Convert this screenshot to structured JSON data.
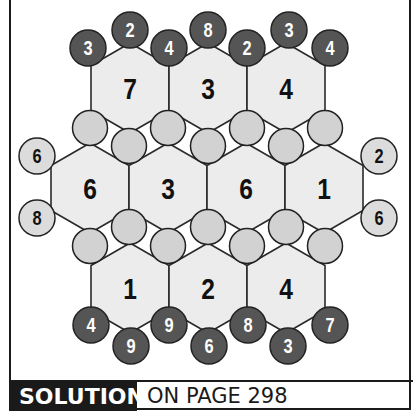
{
  "puzzle": {
    "colors": {
      "hex_fill": "#ececec",
      "hex_stroke": "#2a2a2a",
      "gap_circle_fill": "#d2d2d2",
      "dark_clue_fill": "#555555",
      "light_clue_fill": "#dcdcdc",
      "stroke": "#222222",
      "dark_text": "#ffffff",
      "light_text": "#111111",
      "hex_text": "#111111"
    },
    "hex_radius": 45,
    "hexes": [
      {
        "cx": 130,
        "cy": 88,
        "value": "7"
      },
      {
        "cx": 208,
        "cy": 88,
        "value": "3"
      },
      {
        "cx": 286,
        "cy": 88,
        "value": "4"
      },
      {
        "cx": 90,
        "cy": 188,
        "value": "6"
      },
      {
        "cx": 168,
        "cy": 188,
        "value": "3"
      },
      {
        "cx": 246,
        "cy": 188,
        "value": "6"
      },
      {
        "cx": 324,
        "cy": 188,
        "value": "1"
      },
      {
        "cx": 130,
        "cy": 288,
        "value": "1"
      },
      {
        "cx": 208,
        "cy": 288,
        "value": "2"
      },
      {
        "cx": 286,
        "cy": 288,
        "value": "4"
      }
    ],
    "gap_circles": [
      {
        "cx": 90,
        "cy": 128,
        "value": ""
      },
      {
        "cx": 129,
        "cy": 146,
        "value": ""
      },
      {
        "cx": 168,
        "cy": 128,
        "value": ""
      },
      {
        "cx": 208,
        "cy": 146,
        "value": ""
      },
      {
        "cx": 247,
        "cy": 128,
        "value": ""
      },
      {
        "cx": 286,
        "cy": 146,
        "value": ""
      },
      {
        "cx": 325,
        "cy": 128,
        "value": ""
      },
      {
        "cx": 90,
        "cy": 246,
        "value": ""
      },
      {
        "cx": 129,
        "cy": 227,
        "value": ""
      },
      {
        "cx": 168,
        "cy": 246,
        "value": ""
      },
      {
        "cx": 208,
        "cy": 227,
        "value": ""
      },
      {
        "cx": 247,
        "cy": 246,
        "value": ""
      },
      {
        "cx": 286,
        "cy": 227,
        "value": ""
      },
      {
        "cx": 325,
        "cy": 246,
        "value": ""
      }
    ],
    "top_clues": [
      {
        "cx": 88,
        "cy": 48,
        "value": "3"
      },
      {
        "cx": 130,
        "cy": 30,
        "value": "2"
      },
      {
        "cx": 169,
        "cy": 48,
        "value": "4"
      },
      {
        "cx": 208,
        "cy": 30,
        "value": "8"
      },
      {
        "cx": 247,
        "cy": 48,
        "value": "2"
      },
      {
        "cx": 289,
        "cy": 30,
        "value": "3"
      },
      {
        "cx": 330,
        "cy": 48,
        "value": "4"
      }
    ],
    "bottom_clues": [
      {
        "cx": 91,
        "cy": 325,
        "value": "4"
      },
      {
        "cx": 131,
        "cy": 346,
        "value": "9"
      },
      {
        "cx": 169,
        "cy": 325,
        "value": "9"
      },
      {
        "cx": 209,
        "cy": 346,
        "value": "6"
      },
      {
        "cx": 248,
        "cy": 325,
        "value": "8"
      },
      {
        "cx": 288,
        "cy": 346,
        "value": "3"
      },
      {
        "cx": 330,
        "cy": 325,
        "value": "7"
      }
    ],
    "left_clues": [
      {
        "cx": 37,
        "cy": 156,
        "value": "6"
      },
      {
        "cx": 37,
        "cy": 218,
        "value": "8"
      }
    ],
    "right_clues": [
      {
        "cx": 379,
        "cy": 156,
        "value": "2"
      },
      {
        "cx": 379,
        "cy": 218,
        "value": "6"
      }
    ]
  },
  "footer": {
    "solution_label": "SOLUTION",
    "solution_ref": "ON PAGE 298"
  }
}
